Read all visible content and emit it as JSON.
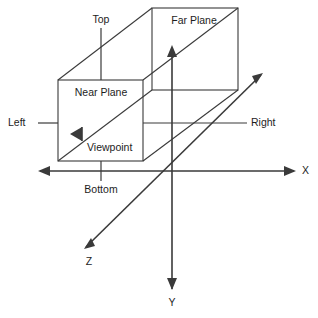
{
  "diagram": {
    "background_color": "#ffffff",
    "line_color": "#3a3a3a",
    "text_color": "#1d1d1d",
    "labels": {
      "top": "Top",
      "bottom": "Bottom",
      "left": "Left",
      "right": "Right",
      "near_plane": "Near Plane",
      "far_plane": "Far Plane",
      "viewpoint": "Viewpoint"
    },
    "axes": [
      {
        "name": "x-axis",
        "label": "X"
      },
      {
        "name": "y-axis",
        "label": "Y"
      },
      {
        "name": "z-axis",
        "label": "Z"
      }
    ],
    "shapes": [
      {
        "name": "near-plane-rect",
        "label": "Near Plane"
      },
      {
        "name": "far-plane-rect",
        "label": "Far Plane"
      },
      {
        "name": "viewpoint-marker",
        "label": "Viewpoint"
      }
    ]
  }
}
